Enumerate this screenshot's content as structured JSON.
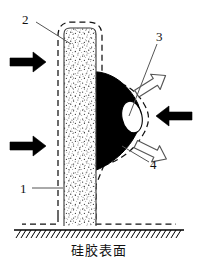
{
  "figure": {
    "domain": "technical-cross-section-diagram",
    "caption": "硅胶表面",
    "background_color": "#ffffff",
    "ink_color": "#000000",
    "callouts": [
      {
        "id": "1",
        "label": "1",
        "target": "stippled-column-body",
        "leader": "horizontal-line-right"
      },
      {
        "id": "2",
        "label": "2",
        "target": "column-top-inner-edge",
        "leader": "diagonal-line-down-right"
      },
      {
        "id": "3",
        "label": "3",
        "target": "white-ellipse-tip",
        "leader": "diagonal-line-down-left"
      },
      {
        "id": "4",
        "label": "4",
        "target": "dashed-bulge-outline",
        "leader": "diagonal-line-up-left"
      }
    ],
    "elements": {
      "column": {
        "name": "stippled-vertical-column",
        "fill": "stipple-dots",
        "outline": "solid",
        "ghost_outline": "dashed"
      },
      "bulge": {
        "name": "black-protruding-mass",
        "fill": "#000000",
        "ghost_outline": "dashed"
      },
      "tip": {
        "name": "white-ellipse-tip",
        "fill": "#ffffff",
        "outline": "solid-thin"
      },
      "ground": {
        "name": "hatched-ground-surface",
        "style": "solid-line-with-diagonal-hatching"
      }
    },
    "arrows": [
      {
        "id": "left-upper",
        "style": "solid-filled",
        "color": "#000000",
        "direction": "right"
      },
      {
        "id": "left-lower",
        "style": "solid-filled",
        "color": "#000000",
        "direction": "right"
      },
      {
        "id": "right-middle",
        "style": "solid-filled",
        "color": "#000000",
        "direction": "left"
      },
      {
        "id": "right-upper",
        "style": "hollow-outline",
        "color": "#ffffff",
        "direction": "up-right"
      },
      {
        "id": "right-lower",
        "style": "hollow-outline",
        "color": "#ffffff",
        "direction": "down-right"
      }
    ]
  }
}
